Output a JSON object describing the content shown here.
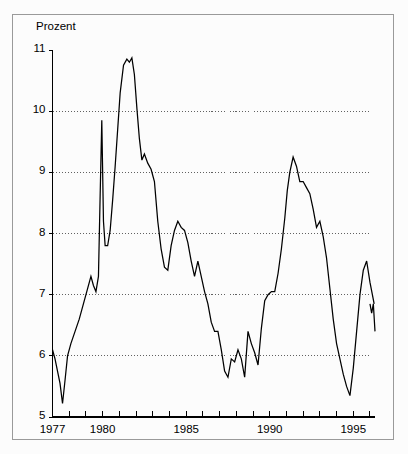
{
  "chart_data": {
    "type": "line",
    "title": "",
    "ylabel": "Prozent",
    "xlabel": "",
    "ylim": [
      5,
      11
    ],
    "xlim": [
      1977.0,
      1996.3
    ],
    "grid": true,
    "grid_axis": "y",
    "grid_values": [
      10,
      9,
      8,
      7,
      6
    ],
    "legend": null,
    "y_ticks": [
      {
        "value": 11,
        "label": "11"
      },
      {
        "value": 10,
        "label": "10"
      },
      {
        "value": 9,
        "label": "9"
      },
      {
        "value": 8,
        "label": "8"
      },
      {
        "value": 7,
        "label": "7"
      },
      {
        "value": 6,
        "label": "6"
      },
      {
        "value": 5,
        "label": "5"
      }
    ],
    "x_ticks": [
      {
        "value": 1977,
        "label": "1977"
      },
      {
        "value": 1978,
        "label": ""
      },
      {
        "value": 1979,
        "label": ""
      },
      {
        "value": 1980,
        "label": "1980"
      },
      {
        "value": 1981,
        "label": ""
      },
      {
        "value": 1982,
        "label": ""
      },
      {
        "value": 1983,
        "label": ""
      },
      {
        "value": 1984,
        "label": ""
      },
      {
        "value": 1985,
        "label": "1985"
      },
      {
        "value": 1986,
        "label": ""
      },
      {
        "value": 1987,
        "label": ""
      },
      {
        "value": 1988,
        "label": ""
      },
      {
        "value": 1989,
        "label": ""
      },
      {
        "value": 1990,
        "label": "1990"
      },
      {
        "value": 1991,
        "label": ""
      },
      {
        "value": 1992,
        "label": ""
      },
      {
        "value": 1993,
        "label": ""
      },
      {
        "value": 1994,
        "label": ""
      },
      {
        "value": 1995,
        "label": "1995"
      },
      {
        "value": 1996,
        "label": ""
      }
    ],
    "series": [
      {
        "name": "Prozent",
        "color": "#000000",
        "x": [
          1977.0,
          1977.15,
          1977.3,
          1977.45,
          1977.6,
          1977.75,
          1977.9,
          1978.1,
          1978.35,
          1978.6,
          1978.85,
          1979.1,
          1979.3,
          1979.45,
          1979.6,
          1979.75,
          1979.85,
          1979.95,
          1980.05,
          1980.15,
          1980.3,
          1980.45,
          1980.6,
          1980.75,
          1980.9,
          1981.05,
          1981.25,
          1981.45,
          1981.6,
          1981.75,
          1981.9,
          1982.05,
          1982.2,
          1982.35,
          1982.5,
          1982.7,
          1982.9,
          1983.1,
          1983.3,
          1983.5,
          1983.7,
          1983.9,
          1984.1,
          1984.3,
          1984.5,
          1984.7,
          1984.9,
          1985.1,
          1985.3,
          1985.5,
          1985.7,
          1985.9,
          1986.1,
          1986.3,
          1986.5,
          1986.7,
          1986.9,
          1987.1,
          1987.3,
          1987.5,
          1987.7,
          1987.9,
          1988.1,
          1988.3,
          1988.5,
          1988.7,
          1988.9,
          1989.1,
          1989.3,
          1989.5,
          1989.7,
          1989.9,
          1990.1,
          1990.3,
          1990.5,
          1990.7,
          1990.9,
          1991.05,
          1991.2,
          1991.4,
          1991.6,
          1991.8,
          1992.0,
          1992.2,
          1992.4,
          1992.6,
          1992.8,
          1993.0,
          1993.2,
          1993.4,
          1993.6,
          1993.8,
          1994.0,
          1994.2,
          1994.4,
          1994.6,
          1994.8,
          1995.0,
          1995.2,
          1995.4,
          1995.6,
          1995.8,
          1996.0,
          1996.25
        ],
        "y": [
          6.1,
          5.95,
          5.75,
          5.55,
          5.22,
          5.6,
          6.0,
          6.2,
          6.4,
          6.6,
          6.85,
          7.1,
          7.3,
          7.15,
          7.05,
          7.3,
          8.6,
          9.85,
          8.2,
          7.8,
          7.8,
          8.05,
          8.55,
          9.1,
          9.7,
          10.3,
          10.75,
          10.85,
          10.8,
          10.87,
          10.6,
          10.05,
          9.55,
          9.2,
          9.3,
          9.15,
          9.05,
          8.85,
          8.2,
          7.75,
          7.45,
          7.4,
          7.8,
          8.05,
          8.2,
          8.1,
          8.05,
          7.85,
          7.55,
          7.3,
          7.55,
          7.3,
          7.05,
          6.85,
          6.55,
          6.4,
          6.4,
          6.1,
          5.75,
          5.65,
          5.95,
          5.9,
          6.1,
          5.95,
          5.65,
          6.4,
          6.2,
          6.05,
          5.85,
          6.45,
          6.9,
          7.0,
          7.05,
          7.05,
          7.35,
          7.75,
          8.25,
          8.7,
          9.0,
          9.25,
          9.1,
          8.85,
          8.85,
          8.75,
          8.65,
          8.4,
          8.1,
          8.2,
          7.95,
          7.6,
          7.1,
          6.6,
          6.2,
          5.95,
          5.7,
          5.5,
          5.35,
          5.8,
          6.4,
          7.0,
          7.4,
          7.55,
          7.2,
          6.85
        ]
      },
      {
        "name": "Prozent-tail",
        "color": "#000000",
        "x": [
          1996.0,
          1996.1,
          1996.2,
          1996.3
        ],
        "y": [
          6.85,
          6.7,
          6.85,
          6.4
        ]
      }
    ]
  }
}
